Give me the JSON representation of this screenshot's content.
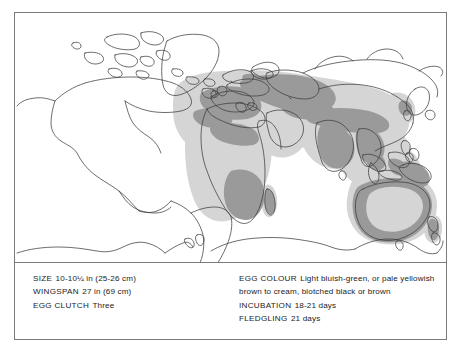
{
  "figure": {
    "type": "distribution-range-map",
    "map_projection": "world-equirectangular",
    "legend_colors": {
      "breeding_range": "#9a9a9a",
      "wider_range": "#d5d5d5",
      "coastline": "#3c3c3c",
      "frame": "#7b7b7b",
      "background": "#ffffff",
      "text": "#1b1b1b"
    },
    "shaded_regions": [
      "Europe",
      "Mediterranean",
      "North Africa",
      "Sub-Saharan Africa",
      "Southern Africa",
      "Madagascar",
      "Middle East",
      "Central Asia",
      "Indian subcontinent",
      "Southeast Asia",
      "Indonesia",
      "Australia",
      "New Zealand"
    ]
  },
  "info": {
    "left": [
      {
        "key": "SIZE",
        "value": "10-10¼ in (25-26 cm)"
      },
      {
        "key": "WINGSPAN",
        "value": "27 in (69 cm)"
      },
      {
        "key": "EGG CLUTCH",
        "value": "Three"
      }
    ],
    "right": [
      {
        "key": "EGG COLOUR",
        "value": "Light bluish-green, or pale yellowish brown to cream, blotched black or brown"
      },
      {
        "key": "INCUBATION",
        "value": "18-21 days"
      },
      {
        "key": "FLEDGLING",
        "value": "21 days"
      }
    ]
  }
}
